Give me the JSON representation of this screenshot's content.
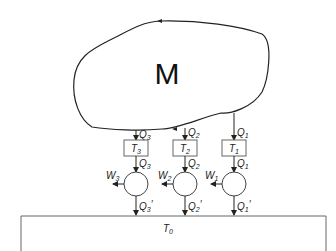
{
  "diagram": {
    "reservoir_label": "M",
    "sink_label": "T",
    "sink_sub": "0",
    "engines": [
      {
        "id": 3,
        "temp": "T",
        "temp_sub": "3",
        "q_in": "Q",
        "q_in_sub": "3",
        "q_mid": "Q",
        "q_mid_sub": "3",
        "work": "W",
        "work_sub": "3",
        "q_out": "Q",
        "q_out_sub": "3",
        "q_out_prime": "′"
      },
      {
        "id": 2,
        "temp": "T",
        "temp_sub": "2",
        "q_in": "Q",
        "q_in_sub": "2",
        "q_mid": "Q",
        "q_mid_sub": "2",
        "work": "W",
        "work_sub": "2",
        "q_out": "Q",
        "q_out_sub": "2",
        "q_out_prime": "′"
      },
      {
        "id": 1,
        "temp": "T",
        "temp_sub": "1",
        "q_in": "Q",
        "q_in_sub": "1",
        "q_mid": "Q",
        "q_mid_sub": "1",
        "work": "W",
        "work_sub": "1",
        "q_out": "Q",
        "q_out_sub": "1",
        "q_out_prime": "′"
      }
    ]
  }
}
